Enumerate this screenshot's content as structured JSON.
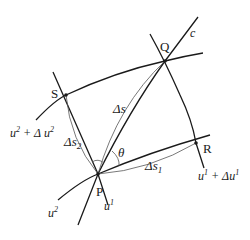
{
  "diagram": {
    "points": {
      "P": {
        "label": "P",
        "x": 98,
        "y": 174
      },
      "Q": {
        "label": "Q",
        "x": 165,
        "y": 61
      },
      "R": {
        "label": "R",
        "x": 196,
        "y": 143
      },
      "S": {
        "label": "S",
        "x": 66,
        "y": 95
      }
    },
    "curves": {
      "c": "c",
      "u1": "u",
      "u1_sup": "1",
      "u2": "u",
      "u2_sup": "2",
      "u1_plus": "u",
      "u1_plus_sup": "1",
      "u1_plus_rest": " + Δu",
      "u1_plus_rest_sup": "1",
      "u2_plus": "u",
      "u2_plus_sup": "2",
      "u2_plus_rest": " + Δ u",
      "u2_plus_rest_sup": "2"
    },
    "arcs": {
      "ds": "Δs",
      "ds1": "Δs",
      "ds1_sub": "1",
      "ds2": "Δs",
      "ds2_sub": "2"
    },
    "angle": "θ",
    "colors": {
      "line": "#1a1a1a",
      "thin": "#555555"
    }
  }
}
